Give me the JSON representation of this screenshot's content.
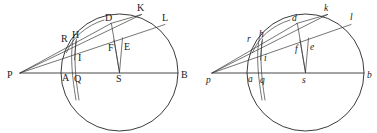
{
  "figure": {
    "type": "geometry-diagram",
    "width": 377,
    "height": 133,
    "background_color": "#ffffff",
    "ink_color": "#262626",
    "panels": [
      {
        "id": "left-panel",
        "label_case": "uppercase",
        "circle": {
          "cx": 119.5,
          "cy": 72.5,
          "r": 58.5
        },
        "external_point": {
          "name": "P",
          "x": 20,
          "y": 73
        },
        "diameter_endpoints": [
          "P",
          "B"
        ],
        "points": [
          {
            "name": "P",
            "x": 20,
            "y": 73,
            "label_x": 7,
            "label_y": 78
          },
          {
            "name": "R",
            "x": 68,
            "y": 44,
            "label_x": 61,
            "label_y": 42
          },
          {
            "name": "H",
            "x": 76,
            "y": 41,
            "label_x": 74,
            "label_y": 38
          },
          {
            "name": "I",
            "x": 75,
            "y": 56,
            "label_x": 78,
            "label_y": 60
          },
          {
            "name": "A",
            "x": 65,
            "y": 73,
            "label_x": 63,
            "label_y": 81
          },
          {
            "name": "Q",
            "x": 76,
            "y": 73,
            "label_x": 75,
            "label_y": 82
          },
          {
            "name": "D",
            "x": 110,
            "y": 23,
            "label_x": 106,
            "label_y": 21
          },
          {
            "name": "F",
            "x": 114,
            "y": 45,
            "label_x": 110,
            "label_y": 50
          },
          {
            "name": "E",
            "x": 124,
            "y": 42,
            "label_x": 125,
            "label_y": 50
          },
          {
            "name": "S",
            "x": 119.5,
            "y": 73,
            "label_x": 117,
            "label_y": 82
          },
          {
            "name": "K",
            "x": 141,
            "y": 14,
            "label_x": 138,
            "label_y": 11
          },
          {
            "name": "L",
            "x": 164,
            "y": 24,
            "label_x": 163,
            "label_y": 21
          },
          {
            "name": "B",
            "x": 178,
            "y": 73,
            "label_x": 182,
            "label_y": 78
          }
        ],
        "segments": [
          {
            "name": "PB-diameter",
            "from": "P",
            "to": "B"
          },
          {
            "name": "PK-secant",
            "from": "P",
            "to": "K"
          },
          {
            "name": "PL-secant",
            "from": "P",
            "to": "L"
          },
          {
            "name": "PD-secant",
            "from": "P",
            "to": "D"
          },
          {
            "name": "SF-radius",
            "from": "S",
            "to": "F"
          },
          {
            "name": "SD-chord",
            "from": "S",
            "to": "D"
          },
          {
            "name": "SE-segment",
            "from": "S",
            "to": "E"
          },
          {
            "name": "QI-vertical",
            "from": "Q",
            "to": "I"
          },
          {
            "name": "HQ-segment",
            "from": "H",
            "to": "Q"
          },
          {
            "name": "AQ-base",
            "from": "A",
            "to": "Q"
          }
        ]
      },
      {
        "id": "right-panel",
        "label_case": "lowercase",
        "circle": {
          "cx": 305.5,
          "cy": 72.5,
          "r": 58.5
        },
        "external_point": {
          "name": "p",
          "x": 212,
          "y": 73
        },
        "diameter_endpoints": [
          "p",
          "b"
        ],
        "points": [
          {
            "name": "p",
            "x": 212,
            "y": 73,
            "label_x": 206,
            "label_y": 82
          },
          {
            "name": "r",
            "x": 254,
            "y": 44,
            "label_x": 248,
            "label_y": 42
          },
          {
            "name": "h",
            "x": 262,
            "y": 41,
            "label_x": 260,
            "label_y": 37
          },
          {
            "name": "i",
            "x": 261,
            "y": 56,
            "label_x": 264,
            "label_y": 60
          },
          {
            "name": "a",
            "x": 251,
            "y": 73,
            "label_x": 249,
            "label_y": 82
          },
          {
            "name": "q",
            "x": 262,
            "y": 73,
            "label_x": 261,
            "label_y": 83
          },
          {
            "name": "d",
            "x": 296,
            "y": 23,
            "label_x": 292,
            "label_y": 21
          },
          {
            "name": "f",
            "x": 300,
            "y": 45,
            "label_x": 296,
            "label_y": 51
          },
          {
            "name": "e",
            "x": 310,
            "y": 42,
            "label_x": 311,
            "label_y": 50
          },
          {
            "name": "s",
            "x": 305.5,
            "y": 73,
            "label_x": 303,
            "label_y": 83
          },
          {
            "name": "k",
            "x": 327,
            "y": 14,
            "label_x": 324,
            "label_y": 11
          },
          {
            "name": "l",
            "x": 350,
            "y": 24,
            "label_x": 350,
            "label_y": 20
          },
          {
            "name": "b",
            "x": 364,
            "y": 73,
            "label_x": 368,
            "label_y": 78
          }
        ],
        "segments": [
          {
            "name": "pb-diameter",
            "from": "p",
            "to": "b"
          },
          {
            "name": "pk-secant",
            "from": "p",
            "to": "k"
          },
          {
            "name": "pl-secant",
            "from": "p",
            "to": "l"
          },
          {
            "name": "pd-secant",
            "from": "p",
            "to": "d"
          },
          {
            "name": "sf-radius",
            "from": "s",
            "to": "f"
          },
          {
            "name": "sd-chord",
            "from": "s",
            "to": "d"
          },
          {
            "name": "se-segment",
            "from": "s",
            "to": "e"
          },
          {
            "name": "qi-vertical",
            "from": "q",
            "to": "i"
          },
          {
            "name": "hq-segment",
            "from": "h",
            "to": "q"
          },
          {
            "name": "aq-base",
            "from": "a",
            "to": "q"
          }
        ]
      }
    ]
  }
}
